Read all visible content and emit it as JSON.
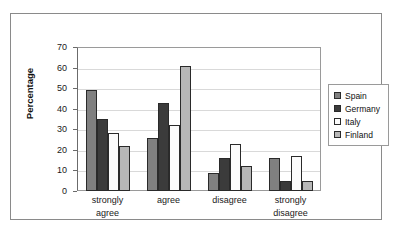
{
  "chart_data": {
    "type": "bar",
    "title": "",
    "xlabel": "",
    "ylabel": "Percentage",
    "ylim": [
      0,
      70
    ],
    "ytick_step": 10,
    "yticks": [
      0,
      10,
      20,
      30,
      40,
      50,
      60,
      70
    ],
    "grid": true,
    "legend_position": "right",
    "categories": [
      "strongly agree",
      "agree",
      "disagree",
      "strongly disagree"
    ],
    "category_lines": [
      [
        "strongly",
        "agree"
      ],
      [
        "agree",
        ""
      ],
      [
        "disagree",
        ""
      ],
      [
        "strongly",
        "disagree"
      ]
    ],
    "series": [
      {
        "name": "Spain",
        "color": "#808080",
        "values": [
          49,
          26,
          9,
          16
        ]
      },
      {
        "name": "Germany",
        "color": "#3b3b3b",
        "values": [
          35,
          43,
          16,
          5
        ]
      },
      {
        "name": "Italy",
        "color": "#fbfbfb",
        "values": [
          28,
          32,
          23,
          17
        ]
      },
      {
        "name": "Finland",
        "color": "#b7b7b7",
        "values": [
          22,
          61,
          12,
          5
        ]
      }
    ]
  }
}
